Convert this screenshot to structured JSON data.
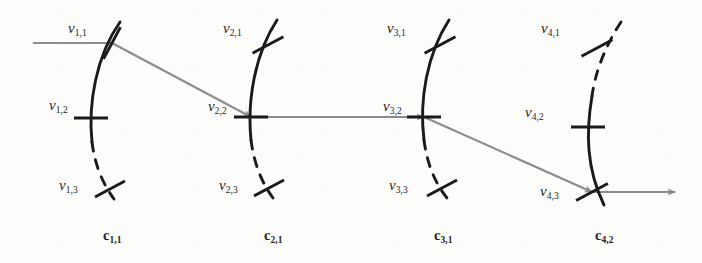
{
  "figure": {
    "type": "diagram",
    "background_color": "#fdfdfc",
    "arc_color": "#1a1a1a",
    "path_color": "#8c8c8c",
    "label_color": "#242424"
  },
  "clusters": [
    {
      "id": "cluster-1",
      "label": "c",
      "label_sub": "1,1",
      "label_x": 103,
      "label_y": 228,
      "arc": {
        "solid": "M 120,22 C 96,56 88,104 92,142",
        "dashed": "M 92,142 C 95,166 103,184 114,199",
        "solid_top_first": true
      },
      "nodes": [
        {
          "id": "v-1-1",
          "label": "v",
          "label_sub": "1,1",
          "label_x": 68,
          "label_y": 21,
          "tick": {
            "x": 112,
            "y": 43,
            "angle": -62,
            "length": 36,
            "dashed_side": false
          },
          "style": "slanted"
        },
        {
          "id": "v-1-2",
          "label": "v",
          "label_sub": "1,2",
          "label_x": 49,
          "label_y": 98,
          "tick": {
            "x": 91,
            "y": 118,
            "angle": 0,
            "length": 34,
            "dashed_side": false
          },
          "style": "horizontal"
        },
        {
          "id": "v-1-3",
          "label": "v",
          "label_sub": "1,3",
          "label_x": 59,
          "label_y": 178,
          "tick": {
            "x": 110,
            "y": 189,
            "angle": -28,
            "length": 34,
            "dashed_side": true
          },
          "style": "slanted"
        }
      ]
    },
    {
      "id": "cluster-2",
      "label": "c",
      "label_sub": "2,1",
      "label_x": 264,
      "label_y": 228,
      "arc": {
        "solid": "M 277,20 C 255,54 247,100 251,140",
        "dashed": "M 251,140 C 254,164 262,183 273,198",
        "solid_top_first": true
      },
      "nodes": [
        {
          "id": "v-2-1",
          "label": "v",
          "label_sub": "2,1",
          "label_x": 223,
          "label_y": 21,
          "tick": {
            "x": 268,
            "y": 45,
            "angle": -28,
            "length": 35,
            "dashed_side": false
          },
          "style": "slanted"
        },
        {
          "id": "v-2-2",
          "label": "v",
          "label_sub": "2,2",
          "label_x": 208,
          "label_y": 99,
          "tick": {
            "x": 251,
            "y": 117,
            "angle": 0,
            "length": 34,
            "dashed_side": false
          },
          "style": "horizontal"
        },
        {
          "id": "v-2-3",
          "label": "v",
          "label_sub": "2,3",
          "label_x": 219,
          "label_y": 178,
          "tick": {
            "x": 269,
            "y": 188,
            "angle": -28,
            "length": 34,
            "dashed_side": true
          },
          "style": "slanted"
        }
      ]
    },
    {
      "id": "cluster-3",
      "label": "c",
      "label_sub": "3,1",
      "label_x": 434,
      "label_y": 228,
      "arc": {
        "solid": "M 449,20 C 427,54 419,100 424,140",
        "dashed": "M 424,140 C 427,164 435,183 447,198",
        "solid_top_first": true
      },
      "nodes": [
        {
          "id": "v-3-1",
          "label": "v",
          "label_sub": "3,1",
          "label_x": 387,
          "label_y": 21,
          "tick": {
            "x": 440,
            "y": 45,
            "angle": -28,
            "length": 35,
            "dashed_side": false
          },
          "style": "slanted"
        },
        {
          "id": "v-3-2",
          "label": "v",
          "label_sub": "3,2",
          "label_x": 383,
          "label_y": 99,
          "tick": {
            "x": 424,
            "y": 117,
            "angle": 0,
            "length": 34,
            "dashed_side": false
          },
          "style": "horizontal"
        },
        {
          "id": "v-3-3",
          "label": "v",
          "label_sub": "3,3",
          "label_x": 389,
          "label_y": 178,
          "tick": {
            "x": 442,
            "y": 188,
            "angle": -28,
            "length": 34,
            "dashed_side": true
          },
          "style": "slanted"
        }
      ]
    },
    {
      "id": "cluster-4",
      "label": "c",
      "label_sub": "4,2",
      "label_x": 595,
      "label_y": 228,
      "arc": {
        "dashed": "M 621,22 C 604,48 595,74 592,96",
        "solid": "M 592,96 C 586,132 586,168 604,205",
        "solid_top_first": false
      },
      "nodes": [
        {
          "id": "v-4-1",
          "label": "v",
          "label_sub": "4,1",
          "label_x": 541,
          "label_y": 21,
          "tick": {
            "x": 597,
            "y": 48,
            "angle": -28,
            "length": 35,
            "dashed_side": true
          },
          "style": "slanted"
        },
        {
          "id": "v-4-2",
          "label": "v",
          "label_sub": "4,2",
          "label_x": 525,
          "label_y": 105,
          "tick": {
            "x": 588,
            "y": 127,
            "angle": 0,
            "length": 34,
            "dashed_side": false
          },
          "style": "horizontal"
        },
        {
          "id": "v-4-3",
          "label": "v",
          "label_sub": "4,3",
          "label_x": 540,
          "label_y": 184,
          "tick": {
            "x": 592,
            "y": 192,
            "angle": -28,
            "length": 36,
            "dashed_side": false
          },
          "style": "slanted"
        }
      ]
    }
  ],
  "path": {
    "color": "#8c8c8c",
    "stroke_width": 2.1,
    "segments": [
      {
        "id": "seg-in",
        "from": [
          33,
          43
        ],
        "to": [
          112,
          43
        ],
        "arrowhead": false,
        "label": "incoming-segment"
      },
      {
        "id": "seg-1-2",
        "from": [
          112,
          43
        ],
        "to": [
          251,
          117
        ],
        "arrowhead": true,
        "label": "v11-to-v22"
      },
      {
        "id": "seg-2-3",
        "from": [
          251,
          117
        ],
        "to": [
          424,
          117
        ],
        "arrowhead": true,
        "label": "v22-to-v32"
      },
      {
        "id": "seg-3-4",
        "from": [
          424,
          117
        ],
        "to": [
          592,
          192
        ],
        "arrowhead": true,
        "label": "v32-to-v43"
      },
      {
        "id": "seg-out",
        "from": [
          592,
          192
        ],
        "to": [
          675,
          192
        ],
        "arrowhead": true,
        "label": "outgoing-segment"
      }
    ]
  }
}
